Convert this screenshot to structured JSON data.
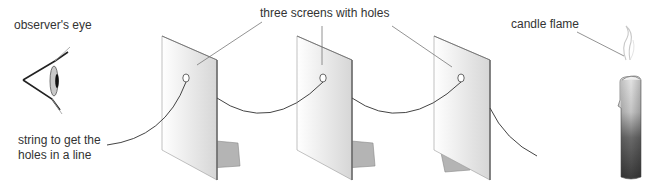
{
  "diagram": {
    "labels": {
      "eye": "observer's eye",
      "screens": "three screens with holes",
      "candle": "candle flame",
      "string_line1": "string to get the",
      "string_line2": "holes in a line"
    },
    "components": [
      "observer's eye",
      "screen 1",
      "screen 2",
      "screen 3",
      "string",
      "candle"
    ],
    "colors": {
      "line": "#555555",
      "text": "#333333",
      "screen_edge": "#666666",
      "candle_dark": "#3a3a3a",
      "candle_light": "#d8d8d8"
    }
  }
}
